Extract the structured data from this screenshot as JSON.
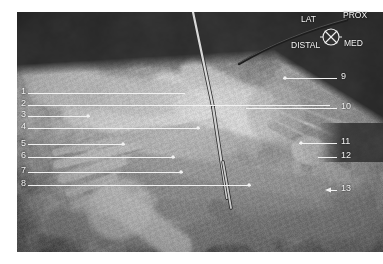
{
  "figure": {
    "type": "anatomical-dissection-photograph",
    "modality": "grayscale-photograph",
    "background_color": "#ffffff",
    "photo_bounds": {
      "x": 17,
      "y": 12,
      "width": 366,
      "height": 240
    },
    "annotation_color": "#f2f2f2"
  },
  "orientation_compass": {
    "name": "orientation-compass",
    "symbol": "crossed-circle-icon",
    "center": {
      "x": 331,
      "y": 37
    },
    "radius": 8,
    "labels": [
      {
        "id": "lat",
        "text": "LAT",
        "x": 301,
        "y": 22
      },
      {
        "id": "prox",
        "text": "PROX",
        "x": 343,
        "y": 18
      },
      {
        "id": "distal",
        "text": "DISTAL",
        "x": 291,
        "y": 48
      },
      {
        "id": "med",
        "text": "MED",
        "x": 344,
        "y": 46
      }
    ]
  },
  "callouts": {
    "left": [
      {
        "number": "1",
        "num_x": 21,
        "num_y": 94,
        "line": {
          "x1": 28,
          "y1": 93,
          "x2": 185,
          "y2": 93
        },
        "dot": null
      },
      {
        "number": "2",
        "num_x": 21,
        "num_y": 106,
        "line": {
          "x1": 28,
          "y1": 105,
          "x2": 330,
          "y2": 105
        },
        "dot": null
      },
      {
        "number": "3",
        "num_x": 21,
        "num_y": 117,
        "line": {
          "x1": 28,
          "y1": 116,
          "x2": 90,
          "y2": 116
        },
        "dot": {
          "x": 88,
          "y": 116
        }
      },
      {
        "number": "4",
        "num_x": 21,
        "num_y": 129,
        "line": {
          "x1": 28,
          "y1": 128,
          "x2": 200,
          "y2": 128
        },
        "dot": {
          "x": 198,
          "y": 128
        }
      },
      {
        "number": "5",
        "num_x": 21,
        "num_y": 146,
        "line": {
          "x1": 28,
          "y1": 144,
          "x2": 125,
          "y2": 144
        },
        "dot": {
          "x": 123,
          "y": 144
        }
      },
      {
        "number": "6",
        "num_x": 21,
        "num_y": 158,
        "line": {
          "x1": 28,
          "y1": 157,
          "x2": 175,
          "y2": 157
        },
        "dot": {
          "x": 173,
          "y": 157
        }
      },
      {
        "number": "7",
        "num_x": 21,
        "num_y": 173,
        "line": {
          "x1": 28,
          "y1": 172,
          "x2": 183,
          "y2": 172
        },
        "dot": {
          "x": 181,
          "y": 172
        }
      },
      {
        "number": "8",
        "num_x": 21,
        "num_y": 186,
        "line": {
          "x1": 28,
          "y1": 185,
          "x2": 251,
          "y2": 185
        },
        "dot": {
          "x": 249,
          "y": 185
        }
      }
    ],
    "right": [
      {
        "number": "9",
        "num_x": 341,
        "num_y": 79,
        "line": {
          "x1": 283,
          "y1": 78,
          "x2": 337,
          "y2": 78
        },
        "dot": {
          "x": 285,
          "y": 78
        },
        "arrow": false
      },
      {
        "number": "10",
        "num_x": 341,
        "num_y": 109,
        "line": {
          "x1": 246,
          "y1": 108,
          "x2": 337,
          "y2": 108
        },
        "dot": null,
        "arrow": false
      },
      {
        "number": "11",
        "num_x": 341,
        "num_y": 144,
        "line": {
          "x1": 299,
          "y1": 143,
          "x2": 337,
          "y2": 143
        },
        "dot": {
          "x": 301,
          "y": 143
        },
        "arrow": false
      },
      {
        "number": "12",
        "num_x": 341,
        "num_y": 158,
        "line": {
          "x1": 318,
          "y1": 157,
          "x2": 337,
          "y2": 157
        },
        "dot": null,
        "arrow": false
      },
      {
        "number": "13",
        "num_x": 341,
        "num_y": 191,
        "line": {
          "x1": 329,
          "y1": 190,
          "x2": 337,
          "y2": 190
        },
        "dot": null,
        "arrow": true
      }
    ]
  }
}
